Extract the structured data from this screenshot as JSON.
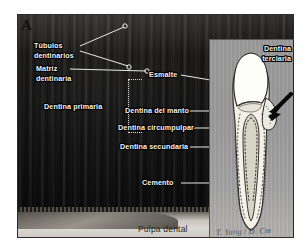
{
  "figure": {
    "panel_letter": "A",
    "type": "histology-micrograph-with-diagram-inset",
    "language": "es"
  },
  "labels": {
    "tubulos": "Túbulos\ndentinarios",
    "tubulos_line1": "Túbulos",
    "tubulos_line2": "dentinarios",
    "matriz_line1": "Matriz",
    "matriz_line2": "dentinaria",
    "dentina_primaria": "Dentina primaria",
    "esmalte": "Esmalte",
    "dentina_del_manto": "Dentina del manto",
    "dentina_circumpulpar": "Dentina circumpulpar",
    "dentina_secundaria": "Dentina secundaria",
    "cemento": "Cemento",
    "pulpa_dental": "Pulpa dental",
    "dentina_terciaria_line1": "Dentina",
    "dentina_terciaria_line2": "terciaria"
  },
  "inset": {
    "signature": "T. Yang / D. Cm",
    "arrow_points_to": "dentina terciaria (zona reparativa)"
  },
  "colors": {
    "micrograph_dark": "#0d0c0b",
    "label_text": "#f2f2f2",
    "label_outline": "#000000",
    "leader_line": "#e8e8e8",
    "inset_background": "#9b9b9b",
    "enamel_fill": "#fdfdfa",
    "dentin_fill": "#f3f1e8",
    "pulp_fill": "#d7d4c8",
    "pulp_band": "#d2cec7"
  }
}
